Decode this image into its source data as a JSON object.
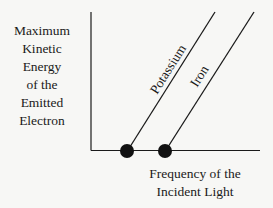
{
  "diagram": {
    "title": "",
    "y_axis_label_lines": [
      "Maximum",
      "Kinetic",
      "Energy",
      "of the",
      "Emitted",
      "Electron"
    ],
    "x_axis_label_lines": [
      "Frequency of the",
      "Incident Light"
    ],
    "lines": [
      {
        "name": "Potassium",
        "threshold_marker": "filled-circle"
      },
      {
        "name": "Iron",
        "threshold_marker": "filled-circle"
      }
    ],
    "colors": {
      "ink": "#1a1a1a",
      "background": "#f7f7f5"
    }
  }
}
